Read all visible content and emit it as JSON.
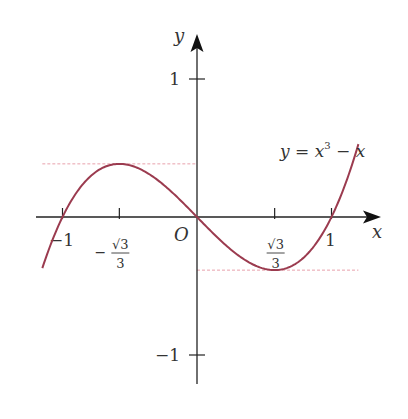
{
  "chart_data": {
    "type": "line",
    "title": "",
    "xlabel": "x",
    "ylabel": "y",
    "origin_label": "O",
    "function_label": "y = x³ − x",
    "function_label_parts": {
      "lhs": "y = x",
      "exp": "3",
      "rhs": " − x"
    },
    "xlim": [
      -1.15,
      1.2
    ],
    "ylim": [
      -1.0,
      1.0
    ],
    "grid": false,
    "x_ticks": [
      {
        "value": -1,
        "label": "−1"
      },
      {
        "value": -0.57735,
        "label": "−√3/3",
        "sign": "−",
        "num": "√3",
        "den": "3"
      },
      {
        "value": 0.57735,
        "label": "√3/3",
        "num": "√3",
        "den": "3"
      },
      {
        "value": 1,
        "label": "1"
      }
    ],
    "y_ticks": [
      {
        "value": 1,
        "label": "1"
      },
      {
        "value": -1,
        "label": "−1"
      }
    ],
    "series": [
      {
        "name": "y = x^3 - x",
        "color": "#9b3b4f",
        "x": [
          -1.15,
          -1.0,
          -0.8,
          -0.57735,
          -0.4,
          -0.2,
          0,
          0.2,
          0.4,
          0.57735,
          0.8,
          1.0,
          1.2
        ],
        "values": [
          -0.371,
          0,
          0.288,
          0.385,
          0.336,
          0.192,
          0,
          -0.192,
          -0.336,
          -0.385,
          -0.288,
          0,
          0.528
        ]
      }
    ],
    "reference_lines": [
      {
        "type": "horizontal",
        "y": 0.385,
        "from_x": -1.15,
        "to_x": 0,
        "color": "#e8a0ab",
        "style": "dashed",
        "label": "local maximum"
      },
      {
        "type": "horizontal",
        "y": -0.385,
        "from_x": 0,
        "to_x": 1.2,
        "color": "#e8a0ab",
        "style": "dashed",
        "label": "local minimum"
      }
    ],
    "critical_points": [
      {
        "x": -0.57735,
        "y": 0.3849,
        "kind": "local max"
      },
      {
        "x": 0.57735,
        "y": -0.3849,
        "kind": "local min"
      }
    ]
  },
  "colors": {
    "axis": "#222222",
    "curve": "#9b3b4f",
    "reference": "#e8a0ab",
    "text": "#333333"
  }
}
